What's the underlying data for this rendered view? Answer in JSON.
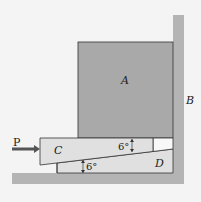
{
  "diagram": {
    "labels": {
      "block_a": "A",
      "wall_b": "B",
      "wedge_c": "C",
      "block_d": "D",
      "force_p": "P",
      "angle_top": "6°",
      "angle_bottom": "6°"
    },
    "colors": {
      "background": "#f4f4f4",
      "block_a_fill": "#a9a9a9",
      "wall_fill": "#b4b4b4",
      "wedge_fill": "#e0e0e0",
      "line": "#333333",
      "arrow": "#555555"
    }
  }
}
